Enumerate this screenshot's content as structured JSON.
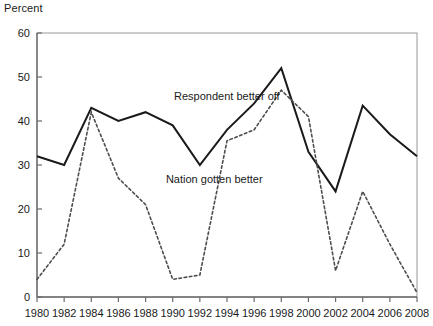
{
  "chart_data": {
    "type": "line",
    "title": "",
    "subtitle": "",
    "xlabel": "",
    "ylabel": "Percent",
    "ylim": [
      0,
      60
    ],
    "xlim": [
      1980,
      2008
    ],
    "yticks": [
      0,
      10,
      20,
      30,
      40,
      50,
      60
    ],
    "grid": false,
    "legend_position": "inline-annotations",
    "categories": [
      1980,
      1982,
      1984,
      1986,
      1988,
      1990,
      1992,
      1994,
      1996,
      1998,
      2000,
      2002,
      2004,
      2006,
      2008
    ],
    "xticklabels": [
      "1980",
      "1982",
      "1984",
      "1986",
      "1988",
      "1990",
      "1992",
      "1994",
      "1996",
      "1998",
      "2000",
      "2002",
      "2004",
      "2006",
      "2008"
    ],
    "series": [
      {
        "name": "Respondent better off",
        "style": "solid",
        "color": "#1a1a1a",
        "values": [
          32,
          30,
          43,
          40,
          42,
          39,
          30,
          38,
          44,
          52,
          33,
          24,
          43.5,
          37,
          32
        ]
      },
      {
        "name": "Nation gotten better",
        "style": "dashed",
        "color": "#4d4d4d",
        "values": [
          4,
          12,
          42,
          27,
          21,
          4,
          5,
          35.5,
          38,
          47,
          41,
          6,
          24,
          12,
          1
        ]
      }
    ],
    "annotations": [
      {
        "text": "Respondent better off",
        "x": 1990.1,
        "y": 45.5
      },
      {
        "text": "Nation gotten better",
        "x": 1989.5,
        "y": 26.5
      }
    ]
  }
}
